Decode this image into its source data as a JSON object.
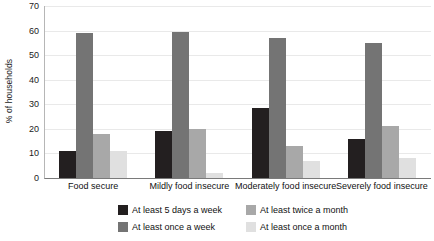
{
  "chart_data": {
    "type": "bar",
    "title": "",
    "subtitle": "",
    "xlabel": "",
    "ylabel": "% of households",
    "ylim": [
      0,
      70
    ],
    "ytick_step": 10,
    "yticks": [
      "0",
      "10",
      "20",
      "30",
      "40",
      "50",
      "60",
      "70"
    ],
    "grid": true,
    "legend_position": "bottom",
    "categories": [
      "Food secure",
      "Mildly food insecure",
      "Moderately food insecure",
      "Severely food insecure"
    ],
    "series": [
      {
        "name": "At least 5 days a week",
        "color": "#231f20",
        "values": [
          11,
          19,
          28.5,
          16
        ]
      },
      {
        "name": "At least once a week",
        "color": "#747474",
        "values": [
          59,
          59.5,
          57,
          55
        ]
      },
      {
        "name": "At least twice a month",
        "color": "#a8a8a8",
        "values": [
          18,
          20,
          13,
          21
        ]
      },
      {
        "name": "At least once a month",
        "color": "#e0e0e0",
        "values": [
          11,
          2,
          7,
          8
        ]
      }
    ]
  },
  "legend": {
    "entries": [
      {
        "label": "At least 5 days a week",
        "color": "#231f20"
      },
      {
        "label": "At least twice a month",
        "color": "#a8a8a8"
      },
      {
        "label": "At least once a week",
        "color": "#747474"
      },
      {
        "label": "At least once a month",
        "color": "#e0e0e0"
      }
    ]
  },
  "axis": {
    "line_color": "#7a7a7a",
    "grid_color": "#e9e9e9"
  }
}
